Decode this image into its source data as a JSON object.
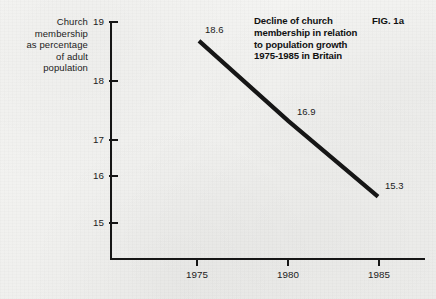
{
  "figure": {
    "number_label": "FIG. 1a",
    "title_lines": [
      "Decline of church",
      "membership in relation",
      "to population growth",
      "1975-1985 in Britain"
    ],
    "y_caption_lines": [
      "Church",
      "membership",
      "as percentage",
      "of adult",
      "population"
    ]
  },
  "chart_data": {
    "type": "line",
    "title": "Decline of church membership in relation to population growth 1975-1985 in Britain",
    "xlabel": "",
    "ylabel": "Church membership as percentage of adult population",
    "categories": [
      "1975",
      "1980",
      "1985"
    ],
    "x": [
      1975,
      1980,
      1985
    ],
    "values": [
      18.6,
      16.9,
      15.3
    ],
    "point_labels": [
      "18.6",
      "16.9",
      "15.3"
    ],
    "xlim": [
      1975,
      1985
    ],
    "ylim": [
      15,
      19
    ],
    "x_ticks": [
      "1975",
      "1980",
      "1985"
    ],
    "y_ticks": [
      "19",
      "18",
      "17",
      "16",
      "15"
    ],
    "grid": false,
    "legend": false,
    "line_color": "#161616",
    "axis_color": "#161616",
    "background_color": "#f3f3f1"
  }
}
